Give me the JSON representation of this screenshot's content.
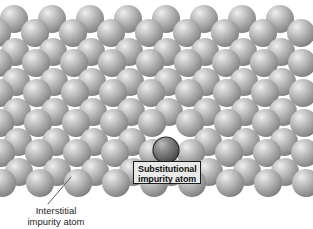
{
  "figure": {
    "type": "crystal-lattice-diagram",
    "background_color": "#ffffff",
    "width": 313,
    "height": 229
  },
  "atoms": {
    "host_color": "#a8a8a8",
    "host_highlight": "#e8e8e8",
    "host_shadow": "#6e6e6e",
    "host_radius": 14,
    "impurity_color": "#6f6f6f",
    "impurity_highlight": "#b9b9b9",
    "impurity_shadow": "#3a3a3a",
    "impurity_outline": "#2b2b2b",
    "impurity_center": {
      "x": 166,
      "y": 150
    },
    "impurity_radius": 13,
    "rows": [
      {
        "y": 19,
        "x_start": 14,
        "count": 8,
        "step": 38
      },
      {
        "y": 33,
        "x_start": -3,
        "count": 9,
        "step": 38
      },
      {
        "y": 52,
        "x_start": 15,
        "count": 8,
        "step": 38
      },
      {
        "y": 63,
        "x_start": -2,
        "count": 9,
        "step": 38
      },
      {
        "y": 82,
        "x_start": 16,
        "count": 8,
        "step": 38
      },
      {
        "y": 93,
        "x_start": -1,
        "count": 9,
        "step": 38
      },
      {
        "y": 112,
        "x_start": 17,
        "count": 8,
        "step": 38
      },
      {
        "y": 123,
        "x_start": 0,
        "count": 9,
        "step": 38
      },
      {
        "y": 142,
        "x_start": 18,
        "count": 8,
        "step": 38
      },
      {
        "y": 153,
        "x_start": 1,
        "count": 9,
        "step": 38
      },
      {
        "y": 172,
        "x_start": 19,
        "count": 8,
        "step": 38
      },
      {
        "y": 183,
        "x_start": 2,
        "count": 9,
        "step": 38
      }
    ]
  },
  "substitutional_callout": {
    "line1": "Substitutional",
    "line2": "impurity atom",
    "box": {
      "left": 133,
      "top": 161,
      "width": 68,
      "height": 23
    }
  },
  "interstitial_callout": {
    "line1": "Interstitial",
    "line2": "impurity atom",
    "label": {
      "left": 10,
      "top": 205,
      "width": 92
    },
    "leader": {
      "x1": 48,
      "y1": 204,
      "x2": 71,
      "y2": 177
    },
    "leader_color": "#5a5a5a"
  }
}
